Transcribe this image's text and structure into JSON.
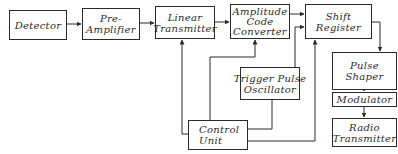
{
  "diagram": {
    "blocks": {
      "detector": {
        "lines": [
          "Detector"
        ]
      },
      "pre_amplifier": {
        "lines": [
          "Pre-",
          "Amplifier"
        ]
      },
      "linear_transmitter": {
        "lines": [
          "Linear",
          "Transmitter"
        ]
      },
      "amplitude_code_converter": {
        "lines": [
          "Amplitude",
          "Code",
          "Converter"
        ]
      },
      "shift_register": {
        "lines": [
          "Shift",
          "Register"
        ]
      },
      "pulse_shaper": {
        "lines": [
          "Pulse",
          "Shaper"
        ]
      },
      "modulator": {
        "lines": [
          "Modulator"
        ]
      },
      "radio_transmitter": {
        "lines": [
          "Radio",
          "Transmitter"
        ]
      },
      "trigger_pulse_oscillator": {
        "lines": [
          "Trigger Pulse",
          "Oscillator"
        ]
      },
      "control_unit": {
        "lines": [
          "Control",
          "Unit"
        ]
      }
    },
    "connections": [
      {
        "from": "Detector",
        "to": "Pre-Amplifier"
      },
      {
        "from": "Pre-Amplifier",
        "to": "Linear Transmitter"
      },
      {
        "from": "Linear Transmitter",
        "to": "Amplitude Code Converter"
      },
      {
        "from": "Amplitude Code Converter",
        "to": "Shift Register"
      },
      {
        "from": "Trigger Pulse Oscillator",
        "to": "Shift Register"
      },
      {
        "from": "Shift Register",
        "to": "Pulse Shaper"
      },
      {
        "from": "Pulse Shaper",
        "to": "Modulator"
      },
      {
        "from": "Modulator",
        "to": "Radio Transmitter"
      },
      {
        "from": "Control Unit",
        "to": "Linear Transmitter"
      },
      {
        "from": "Control Unit",
        "to": "Amplitude Code Converter"
      },
      {
        "from": "Control Unit",
        "to": "Shift Register"
      },
      {
        "from": "Trigger Pulse Oscillator",
        "to": "Control Unit"
      }
    ],
    "colors": {
      "line": "#2a2a2a",
      "background": "#ffffff"
    }
  }
}
